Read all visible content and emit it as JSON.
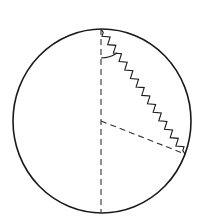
{
  "diagram": {
    "colors": {
      "background": "#ffffff",
      "stroke": "#1a1a1a",
      "dashed": "#333333"
    },
    "circle": {
      "cx": 102,
      "cy": 121,
      "rx": 89,
      "ry": 92
    },
    "spring": {
      "from": [
        101,
        29
      ],
      "to": [
        185,
        154
      ],
      "coils": 14,
      "amplitude": 3.2
    },
    "vertical_diameter": {
      "from": [
        101,
        29
      ],
      "to": [
        101,
        213
      ]
    },
    "radius": {
      "from": [
        101,
        121
      ],
      "to": [
        185,
        154
      ]
    },
    "angle_arc": {
      "at": [
        101,
        29
      ],
      "r": 29
    }
  }
}
